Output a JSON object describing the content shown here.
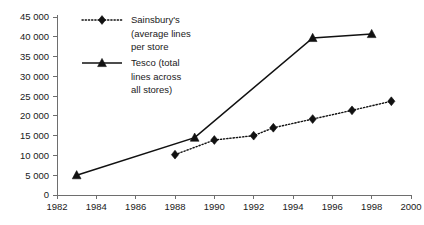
{
  "chart_data": {
    "type": "line",
    "title": "",
    "subtitle": "",
    "xlabel": "",
    "ylabel": "",
    "xlim": [
      1982,
      2000
    ],
    "ylim": [
      0,
      45000
    ],
    "grid": false,
    "legend_position": "top-left-inside",
    "x_ticks": [
      "1982",
      "1984",
      "1986",
      "1988",
      "1990",
      "1992",
      "1994",
      "1996",
      "1998",
      "2000"
    ],
    "x_tick_values": [
      1982,
      1984,
      1986,
      1988,
      1990,
      1992,
      1994,
      1996,
      1998,
      2000
    ],
    "y_ticks": [
      "0",
      "5 000",
      "10 000",
      "15 000",
      "20 000",
      "25 000",
      "30 000",
      "35 000",
      "40 000",
      "45 000"
    ],
    "y_tick_values": [
      0,
      5000,
      10000,
      15000,
      20000,
      25000,
      30000,
      35000,
      40000,
      45000
    ],
    "series": [
      {
        "name": "Sainsbury's (average lines per store",
        "marker": "diamond",
        "line_style": "dotted",
        "color": "#111111",
        "x": [
          1988,
          1990,
          1992,
          1993,
          1995,
          1997,
          1999
        ],
        "values": [
          10200,
          13900,
          15000,
          17000,
          19200,
          21400,
          23700
        ]
      },
      {
        "name": "Tesco (total lines across all stores)",
        "marker": "triangle",
        "line_style": "solid",
        "color": "#111111",
        "x": [
          1983,
          1989,
          1995,
          1998
        ],
        "values": [
          5000,
          14500,
          39700,
          40700
        ]
      }
    ]
  },
  "legend": {
    "entries": [
      {
        "marker": "diamond",
        "line_style": "dotted",
        "lines": [
          "Sainsbury's",
          "(average lines",
          "per store"
        ]
      },
      {
        "marker": "triangle",
        "line_style": "solid",
        "lines": [
          "Tesco (total",
          "lines across",
          "all stores)"
        ]
      }
    ]
  },
  "colors": {
    "ink": "#111111",
    "axis": "#6e6e6e",
    "background": "#ffffff"
  }
}
